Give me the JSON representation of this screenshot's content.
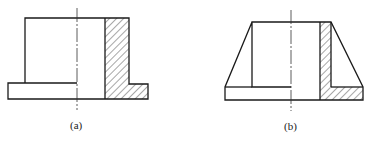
{
  "figures": [
    {
      "id": "a",
      "caption": "(a)",
      "description": "Flanged cylindrical sleeve, half section"
    },
    {
      "id": "b",
      "caption": "(b)",
      "description": "Conical flanged sleeve, half section"
    }
  ]
}
